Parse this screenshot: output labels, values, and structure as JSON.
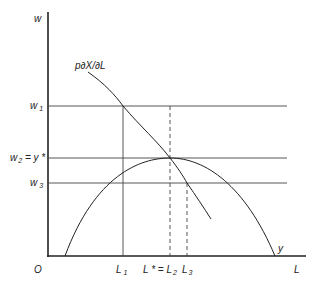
{
  "diagram": {
    "axes": {
      "y_label": "w",
      "x_label": "L",
      "origin_label": "O"
    },
    "curves": {
      "marginal_product_label": "p∂X/∂L",
      "output_label": "y"
    },
    "y_ticks": [
      {
        "label": "w",
        "sub": "1"
      },
      {
        "label": "w",
        "sub": "2",
        "suffix": " = y *"
      },
      {
        "label": "w",
        "sub": "3"
      }
    ],
    "x_ticks": [
      {
        "label": "L",
        "sub": "1"
      },
      {
        "label": "L * = L",
        "sub": "2"
      },
      {
        "label": "L",
        "sub": "3"
      }
    ],
    "colors": {
      "line": "#222222",
      "background": "#ffffff"
    }
  }
}
